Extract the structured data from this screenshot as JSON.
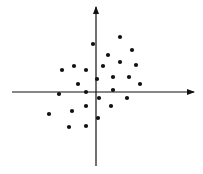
{
  "chart_data": {
    "type": "scatter",
    "title": "",
    "xlabel": "",
    "ylabel": "",
    "grid": false,
    "legend": null,
    "axes": {
      "style": "cartesian-cross-with-arrows",
      "x_axis_y_px": 92,
      "x_axis_from_px": 12,
      "x_axis_to_px": 194,
      "y_axis_x_px": 96,
      "y_axis_from_px": 166,
      "y_axis_to_px": 7,
      "ticks": false
    },
    "units_note": "Values are relative to origin in pixels (x right positive, y up positive); no numeric ticks are shown.",
    "xlim": [
      -84,
      98
    ],
    "ylim": [
      -74,
      85
    ],
    "points": [
      {
        "x": 24,
        "y": 55
      },
      {
        "x": -3,
        "y": 48
      },
      {
        "x": 36,
        "y": 42
      },
      {
        "x": 12,
        "y": 37
      },
      {
        "x": 24,
        "y": 30
      },
      {
        "x": 7,
        "y": 26
      },
      {
        "x": 40,
        "y": 27
      },
      {
        "x": -22,
        "y": 26
      },
      {
        "x": -34,
        "y": 22
      },
      {
        "x": -10,
        "y": 22
      },
      {
        "x": 1,
        "y": 13
      },
      {
        "x": 17,
        "y": 15
      },
      {
        "x": 33,
        "y": 15
      },
      {
        "x": 44,
        "y": 8
      },
      {
        "x": -18,
        "y": 8
      },
      {
        "x": 17,
        "y": 2
      },
      {
        "x": -37,
        "y": -2
      },
      {
        "x": -10,
        "y": 0
      },
      {
        "x": 3,
        "y": -6
      },
      {
        "x": 31,
        "y": -6
      },
      {
        "x": -10,
        "y": -14
      },
      {
        "x": 15,
        "y": -14
      },
      {
        "x": -24,
        "y": -19
      },
      {
        "x": -47,
        "y": -22
      },
      {
        "x": 2,
        "y": -26
      },
      {
        "x": -27,
        "y": -35
      },
      {
        "x": -10,
        "y": -34
      }
    ]
  },
  "colors": {
    "background": "#ffffff",
    "axis": "#111111",
    "point": "#111111"
  }
}
